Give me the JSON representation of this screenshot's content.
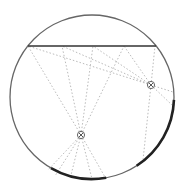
{
  "diagram": {
    "type": "geometry",
    "circle": {
      "cx": 92,
      "cy": 97,
      "r": 82,
      "stroke": "#666666"
    },
    "chord": {
      "x1": 28,
      "y1": 46,
      "x2": 156,
      "y2": 46,
      "stroke": "#333333"
    },
    "points": [
      {
        "id": "P1",
        "x": 151,
        "y": 85
      },
      {
        "id": "P2",
        "x": 81,
        "y": 135
      }
    ],
    "thick_arcs": [
      {
        "id": "arc-right",
        "start_deg": 2,
        "end_deg": 57
      },
      {
        "id": "arc-bottom",
        "start_deg": 80,
        "end_deg": 120
      }
    ],
    "rays_p1": [
      [
        28,
        46
      ],
      [
        62,
        46
      ],
      [
        93,
        46
      ],
      [
        124,
        46
      ],
      [
        155,
        46
      ],
      [
        173,
        92
      ],
      [
        172,
        105
      ],
      [
        143,
        160
      ]
    ],
    "rays_p2": [
      [
        28,
        46
      ],
      [
        62,
        46
      ],
      [
        93,
        46
      ],
      [
        124,
        46
      ],
      [
        55,
        176
      ],
      [
        70,
        179
      ],
      [
        92,
        179
      ],
      [
        105,
        177
      ],
      [
        48,
        170
      ]
    ],
    "ray_color": "#bbbbbb"
  }
}
